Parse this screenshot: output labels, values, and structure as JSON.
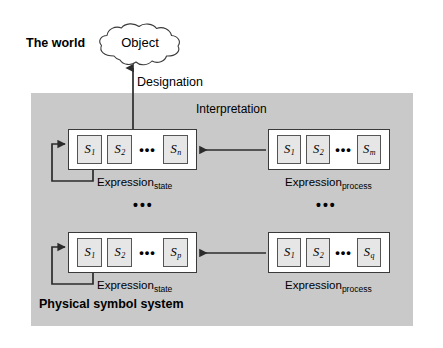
{
  "diagram": {
    "title_world": "The world",
    "title_system": "Physical symbol system",
    "object_label": "Object",
    "designation_label": "Designation",
    "interpretation_label": "Interpretation",
    "row_ellipsis_left": "•••",
    "row_ellipsis_right": "•••",
    "inline_ellipsis": "•••",
    "colors": {
      "panel_gray": "#c9c9c9",
      "symbol_fill": "#e6e6e6",
      "symbol_border": "#555555",
      "box_border": "#3a3a3a",
      "arrow": "#2b2b2b",
      "background": "#ffffff",
      "text": "#000000"
    },
    "rows": [
      {
        "state": {
          "caption_base": "Expression",
          "caption_sub": "state",
          "symbols": [
            {
              "base": "S",
              "sub": "1"
            },
            {
              "base": "S",
              "sub": "2"
            },
            {
              "base": "S",
              "sub": "n"
            }
          ]
        },
        "process": {
          "caption_base": "Expression",
          "caption_sub": "process",
          "symbols": [
            {
              "base": "S",
              "sub": "1"
            },
            {
              "base": "S",
              "sub": "2"
            },
            {
              "base": "S",
              "sub": "m"
            }
          ]
        }
      },
      {
        "state": {
          "caption_base": "Expression",
          "caption_sub": "state",
          "symbols": [
            {
              "base": "S",
              "sub": "1"
            },
            {
              "base": "S",
              "sub": "2"
            },
            {
              "base": "S",
              "sub": "p"
            }
          ]
        },
        "process": {
          "caption_base": "Expression",
          "caption_sub": "process",
          "symbols": [
            {
              "base": "S",
              "sub": "1"
            },
            {
              "base": "S",
              "sub": "2"
            },
            {
              "base": "S",
              "sub": "q"
            }
          ]
        }
      }
    ]
  }
}
